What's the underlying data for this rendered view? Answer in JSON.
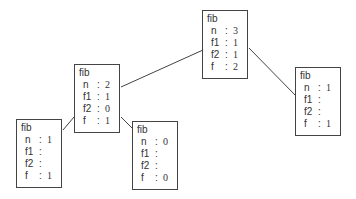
{
  "diagram": {
    "type": "recursion-tree",
    "nodes": [
      {
        "id": "root",
        "title": "fib",
        "fields": [
          {
            "k": "n",
            "v": "3"
          },
          {
            "k": "f1",
            "v": "1"
          },
          {
            "k": "f2",
            "v": "1"
          },
          {
            "k": "f",
            "v": "2"
          }
        ]
      },
      {
        "id": "left",
        "title": "fib",
        "fields": [
          {
            "k": "n",
            "v": "2"
          },
          {
            "k": "f1",
            "v": "1"
          },
          {
            "k": "f2",
            "v": "0"
          },
          {
            "k": "f",
            "v": "1"
          }
        ]
      },
      {
        "id": "right",
        "title": "fib",
        "fields": [
          {
            "k": "n",
            "v": "1"
          },
          {
            "k": "f1",
            "v": ""
          },
          {
            "k": "f2",
            "v": ""
          },
          {
            "k": "f",
            "v": "1"
          }
        ]
      },
      {
        "id": "leftleft",
        "title": "fib",
        "fields": [
          {
            "k": "n",
            "v": "1"
          },
          {
            "k": "f1",
            "v": ""
          },
          {
            "k": "f2",
            "v": ""
          },
          {
            "k": "f",
            "v": "1"
          }
        ]
      },
      {
        "id": "leftright",
        "title": "fib",
        "fields": [
          {
            "k": "n",
            "v": "0"
          },
          {
            "k": "f1",
            "v": ""
          },
          {
            "k": "f2",
            "v": ""
          },
          {
            "k": "f",
            "v": "0"
          }
        ]
      }
    ],
    "edges": [
      {
        "from": "root",
        "to": "left"
      },
      {
        "from": "root",
        "to": "right"
      },
      {
        "from": "left",
        "to": "leftleft"
      },
      {
        "from": "left",
        "to": "leftright"
      }
    ]
  }
}
